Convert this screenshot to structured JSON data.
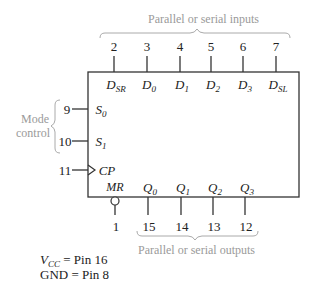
{
  "diagram": {
    "type": "shift-register-pinout",
    "top_label": "Parallel or serial inputs",
    "bottom_label": "Parallel or serial outputs",
    "mode_label_line1": "Mode",
    "mode_label_line2": "control",
    "top_pins": [
      {
        "pin": "2",
        "name": "D",
        "sub": "SR"
      },
      {
        "pin": "3",
        "name": "D",
        "sub": "0"
      },
      {
        "pin": "4",
        "name": "D",
        "sub": "1"
      },
      {
        "pin": "5",
        "name": "D",
        "sub": "2"
      },
      {
        "pin": "6",
        "name": "D",
        "sub": "3"
      },
      {
        "pin": "7",
        "name": "D",
        "sub": "SL"
      }
    ],
    "left_pins": [
      {
        "pin": "9",
        "name": "S",
        "sub": "0"
      },
      {
        "pin": "10",
        "name": "S",
        "sub": "1"
      },
      {
        "pin": "11",
        "name": "CP",
        "sub": ""
      }
    ],
    "bottom_pins": [
      {
        "pin": "1",
        "name": "MR",
        "sub": ""
      },
      {
        "pin": "15",
        "name": "Q",
        "sub": "0"
      },
      {
        "pin": "14",
        "name": "Q",
        "sub": "1"
      },
      {
        "pin": "13",
        "name": "Q",
        "sub": "2"
      },
      {
        "pin": "12",
        "name": "Q",
        "sub": "3"
      }
    ],
    "power": {
      "vcc_name": "V",
      "vcc_sub": "CC",
      "vcc_value": " = Pin 16",
      "gnd_text": "GND = Pin 8"
    },
    "colors": {
      "line": "#333333",
      "annotation": "#9a9a9a"
    }
  }
}
